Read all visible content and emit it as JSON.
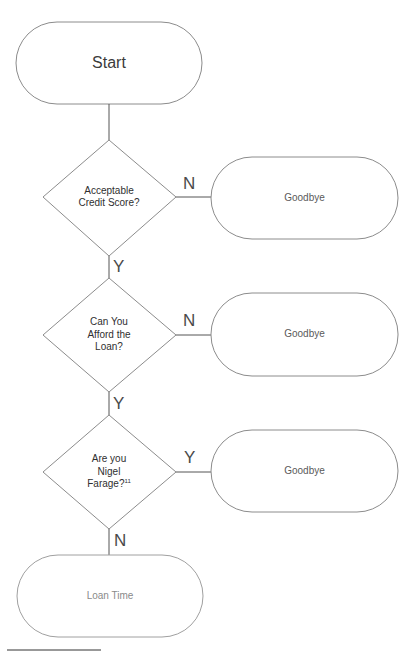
{
  "diagram": {
    "start": {
      "label": "Start"
    },
    "decisions": [
      {
        "label_lines": [
          "Acceptable",
          "Credit Score?"
        ],
        "footnote": ""
      },
      {
        "label_lines": [
          "Can You",
          "Afford the",
          "Loan?"
        ],
        "footnote": ""
      },
      {
        "label_lines": [
          "Are you",
          "Nigel",
          "Farage?"
        ],
        "footnote": "11"
      }
    ],
    "exits": [
      {
        "label": "Goodbye",
        "edge_label": "N"
      },
      {
        "label": "Goodbye",
        "edge_label": "N"
      },
      {
        "label": "Goodbye",
        "edge_label": "Y"
      }
    ],
    "down_edges": [
      "Y",
      "Y",
      "N"
    ],
    "end": {
      "label": "Loan Time"
    }
  },
  "colors": {
    "stroke": "#8c8c8c",
    "connector": "#555555",
    "text": "#3a3a3a"
  }
}
